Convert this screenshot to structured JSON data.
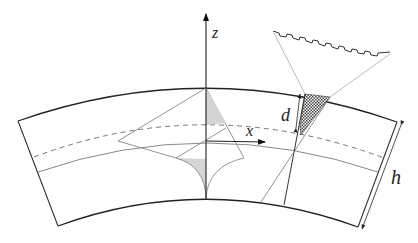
{
  "figure": {
    "type": "geometry-diagram",
    "labels": {
      "z_axis": "z",
      "x_axis": "x",
      "depth": "d",
      "thickness": "h"
    },
    "colors": {
      "stroke_main": "#222222",
      "stroke_light": "#8a8a8a",
      "shade_fill": "#d4d4d4",
      "hatch_fill": "#555555",
      "background": "#ffffff"
    }
  }
}
